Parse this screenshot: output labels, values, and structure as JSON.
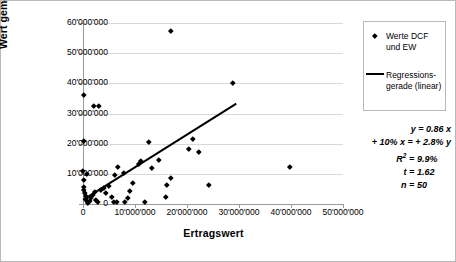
{
  "axes": {
    "y_title": "Wert gemäss DCF-Methode",
    "x_title": "Ertragswert",
    "y_ticks": [
      "0",
      "10'000'000",
      "20'000'000",
      "30'000'000",
      "40'000'000",
      "50'000'000",
      "60'000'000"
    ],
    "x_ticks": [
      "0",
      "10'000'000",
      "20'000'000",
      "30'000'000",
      "40'000'000",
      "50'000'000"
    ]
  },
  "legend": {
    "series_label_line1": "Werte DCF",
    "series_label_line2": "und EW",
    "fit_label_line1": "Regressions-",
    "fit_label_line2": "gerade (linear)"
  },
  "stats": {
    "equation_lhs": "y",
    "equation_eq": "=",
    "equation_rhs": "0.86 x",
    "elasticity": "+ 10% x = + 2.8% y",
    "r2_label": "R",
    "r2_sup": "2",
    "r2_eq": "=",
    "r2_value": "9.9%",
    "t_label": "t",
    "t_eq": "=",
    "t_value": "1.62",
    "n_label": "n",
    "n_eq": "=",
    "n_value": "50"
  },
  "chart_data": {
    "type": "scatter",
    "title": "",
    "xlabel": "Ertragswert",
    "ylabel": "Wert gemäss DCF-Methode",
    "xlim": [
      0,
      50000000
    ],
    "ylim": [
      0,
      60000000
    ],
    "xticks": [
      0,
      10000000,
      20000000,
      30000000,
      40000000,
      50000000
    ],
    "yticks": [
      0,
      10000000,
      20000000,
      30000000,
      40000000,
      50000000,
      60000000
    ],
    "grid": "horizontal",
    "legend_position": "top-right-outside",
    "series": [
      {
        "name": "Werte DCF und EW",
        "marker": "diamond",
        "color": "#000000",
        "points": [
          [
            300000,
            36000000
          ],
          [
            2300000,
            32300000
          ],
          [
            3100000,
            32300000
          ],
          [
            17000000,
            57000000
          ],
          [
            29000000,
            40000000
          ],
          [
            300000,
            20700000
          ],
          [
            12900000,
            20300000
          ],
          [
            21300000,
            21300000
          ],
          [
            200000,
            10800000
          ],
          [
            900000,
            9700000
          ],
          [
            300000,
            7800000
          ],
          [
            6300000,
            9500000
          ],
          [
            8000000,
            10200000
          ],
          [
            6900000,
            12100000
          ],
          [
            10800000,
            13200000
          ],
          [
            11200000,
            14000000
          ],
          [
            14700000,
            14400000
          ],
          [
            13300000,
            11800000
          ],
          [
            20500000,
            18000000
          ],
          [
            22400000,
            17000000
          ],
          [
            24400000,
            6100000
          ],
          [
            40000000,
            12000000
          ],
          [
            17100000,
            8500000
          ],
          [
            16200000,
            6200000
          ],
          [
            16000000,
            2200000
          ],
          [
            400000,
            5600000
          ],
          [
            400000,
            4400000
          ],
          [
            500000,
            3300000
          ],
          [
            600000,
            2400000
          ],
          [
            700000,
            1500000
          ],
          [
            800000,
            700000
          ],
          [
            1100000,
            300000
          ],
          [
            1400000,
            900000
          ],
          [
            1700000,
            1900000
          ],
          [
            2000000,
            2900000
          ],
          [
            2400000,
            3700000
          ],
          [
            2600000,
            1200000
          ],
          [
            3000000,
            400000
          ],
          [
            3500000,
            4600000
          ],
          [
            4200000,
            5200000
          ],
          [
            4600000,
            3400000
          ],
          [
            5200000,
            5900000
          ],
          [
            5600000,
            2100000
          ],
          [
            6100000,
            500000
          ],
          [
            6600000,
            600000
          ],
          [
            8200000,
            600000
          ],
          [
            8700000,
            1800000
          ],
          [
            9200000,
            4100000
          ],
          [
            9800000,
            6700000
          ],
          [
            12100000,
            400000
          ]
        ]
      }
    ],
    "fit": {
      "name": "Regressionsgerade (linear)",
      "type": "line",
      "slope": 0.86,
      "x_start": 0,
      "y_start": 1500000,
      "x_end": 29500000,
      "y_end": 33500000,
      "r_squared": 0.099,
      "t_statistic": 1.62,
      "n": 50
    }
  }
}
